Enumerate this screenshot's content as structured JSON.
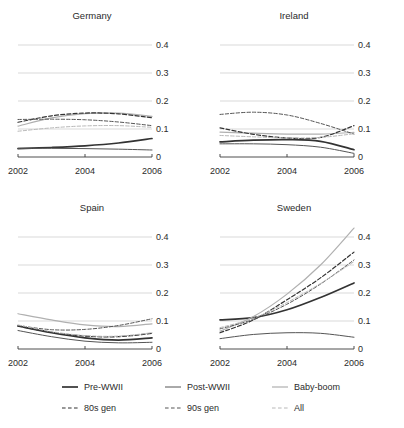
{
  "chart_data": {
    "type": "line",
    "title": "",
    "subtitle": "",
    "xlabel": "",
    "ylabel": "",
    "x": [
      2002,
      2003,
      2004,
      2005,
      2006
    ],
    "xlim": [
      2002,
      2006
    ],
    "ylim": [
      0,
      0.45
    ],
    "xticks": [
      "2002",
      "2004",
      "2006"
    ],
    "xtick_values": [
      2002,
      2004,
      2006
    ],
    "yticks": [
      "0",
      "0.1",
      "0.2",
      "0.3",
      "0.4"
    ],
    "ytick_values": [
      0,
      0.1,
      0.2,
      0.3,
      0.4
    ],
    "grid": "horizontal",
    "legend_position": "bottom",
    "panel_layout": "2x2",
    "series_names": [
      "Pre-WWII",
      "Post-WWII",
      "Baby-boom",
      "80s gen",
      "90s gen",
      "All"
    ],
    "panels": [
      {
        "name": "Germany",
        "series": [
          {
            "name": "Pre-WWII",
            "values": [
              0.03,
              0.034,
              0.04,
              0.05,
              0.066
            ]
          },
          {
            "name": "Post-WWII",
            "values": [
              0.031,
              0.031,
              0.03,
              0.028,
              0.025
            ]
          },
          {
            "name": "Baby-boom",
            "values": [
              0.11,
              0.14,
              0.155,
              0.157,
              0.145
            ]
          },
          {
            "name": "80s gen",
            "values": [
              0.124,
              0.147,
              0.157,
              0.154,
              0.14
            ]
          },
          {
            "name": "90s gen",
            "values": [
              0.134,
              0.135,
              0.133,
              0.125,
              0.112
            ]
          },
          {
            "name": "All",
            "values": [
              0.092,
              0.104,
              0.111,
              0.112,
              0.106
            ]
          }
        ]
      },
      {
        "name": "Ireland",
        "series": [
          {
            "name": "Pre-WWII",
            "values": [
              0.054,
              0.06,
              0.062,
              0.056,
              0.026
            ]
          },
          {
            "name": "Post-WWII",
            "values": [
              0.047,
              0.047,
              0.044,
              0.035,
              0.013
            ]
          },
          {
            "name": "Baby-boom",
            "values": [
              0.089,
              0.085,
              0.082,
              0.082,
              0.088
            ]
          },
          {
            "name": "80s gen",
            "values": [
              0.104,
              0.081,
              0.068,
              0.07,
              0.112
            ]
          },
          {
            "name": "90s gen",
            "values": [
              0.152,
              0.16,
              0.15,
              0.12,
              0.082
            ]
          },
          {
            "name": "All",
            "values": [
              0.077,
              0.072,
              0.068,
              0.07,
              0.083
            ]
          }
        ]
      },
      {
        "name": "Spain",
        "series": [
          {
            "name": "Pre-WWII",
            "values": [
              0.082,
              0.058,
              0.04,
              0.032,
              0.04
            ]
          },
          {
            "name": "Post-WWII",
            "values": [
              0.066,
              0.044,
              0.028,
              0.022,
              0.024
            ]
          },
          {
            "name": "Baby-boom",
            "values": [
              0.126,
              0.104,
              0.086,
              0.08,
              0.09
            ]
          },
          {
            "name": "80s gen",
            "values": [
              0.082,
              0.06,
              0.046,
              0.044,
              0.056
            ]
          },
          {
            "name": "90s gen",
            "values": [
              0.084,
              0.069,
              0.07,
              0.084,
              0.108
            ]
          },
          {
            "name": "All",
            "values": [
              0.086,
              0.062,
              0.048,
              0.046,
              0.058
            ]
          }
        ]
      },
      {
        "name": "Sweden",
        "series": [
          {
            "name": "Pre-WWII",
            "values": [
              0.104,
              0.112,
              0.14,
              0.184,
              0.236
            ]
          },
          {
            "name": "Post-WWII",
            "values": [
              0.037,
              0.052,
              0.058,
              0.056,
              0.042
            ]
          },
          {
            "name": "Baby-boom",
            "values": [
              0.064,
              0.116,
              0.196,
              0.3,
              0.432
            ]
          },
          {
            "name": "80s gen",
            "values": [
              0.058,
              0.104,
              0.176,
              0.254,
              0.346
            ]
          },
          {
            "name": "90s gen",
            "values": [
              0.072,
              0.106,
              0.16,
              0.232,
              0.318
            ]
          },
          {
            "name": "All",
            "values": [
              0.076,
              0.11,
              0.166,
              0.234,
              0.312
            ]
          }
        ]
      }
    ],
    "legend": [
      {
        "label": "Pre-WWII",
        "style": "solid",
        "color": "#333333",
        "width": 1.7
      },
      {
        "label": "Post-WWII",
        "style": "solid",
        "color": "#555555",
        "width": 1.0
      },
      {
        "label": "Baby-boom",
        "style": "solid",
        "color": "#b0b0b0",
        "width": 1.2
      },
      {
        "label": "80s gen",
        "style": "dashed",
        "color": "#333333",
        "width": 1.2
      },
      {
        "label": "90s gen",
        "style": "dashed",
        "color": "#555555",
        "width": 1.0
      },
      {
        "label": "All",
        "style": "dashed",
        "color": "#b8b8b8",
        "width": 1.0
      }
    ]
  },
  "panel_titles": {
    "germany": "Germany",
    "ireland": "Ireland",
    "spain": "Spain",
    "sweden": "Sweden"
  },
  "axes": {
    "x_tick_1": "2002",
    "x_tick_2": "2004",
    "x_tick_3": "2006",
    "y_tick_1": "0",
    "y_tick_2": "0.1",
    "y_tick_3": "0.2",
    "y_tick_4": "0.3",
    "y_tick_5": "0.4"
  },
  "legend_labels": {
    "pre_wwii": "Pre-WWII",
    "post_wwii": "Post-WWII",
    "baby_boom": "Baby-boom",
    "gen_80s": "80s gen",
    "gen_90s": "90s gen",
    "all": "All"
  },
  "colors": {
    "grid": "#c9c9c9",
    "axis": "#3a3a3a",
    "text": "#2b2b2b",
    "dark_line": "#333333",
    "mid_line": "#555555",
    "light_line": "#b0b0b0"
  }
}
